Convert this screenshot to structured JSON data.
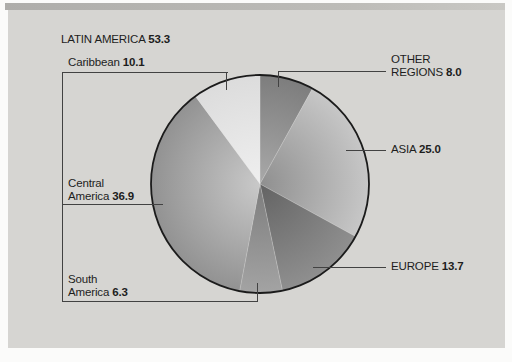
{
  "figure": {
    "panel_background": "#d6d5d2",
    "top_band_color": "#aeadaa",
    "page_color": "#fbfbfa",
    "leader_line_color": "#424242",
    "text_color": "#1d1d1d",
    "pie_outline_color": "#1b1b1b"
  },
  "labels": {
    "latin_america": {
      "name": "LATIN AMERICA",
      "value": "53.3"
    },
    "caribbean": {
      "name": "Caribbean",
      "value": "10.1"
    },
    "central_america": {
      "line1": "Central",
      "line2": "America",
      "value": "36.9"
    },
    "south_america": {
      "line1": "South",
      "line2": "America",
      "value": "6.3"
    },
    "other_regions": {
      "line1": "OTHER",
      "line2": "REGIONS",
      "value": "8.0"
    },
    "asia": {
      "name": "ASIA",
      "value": "25.0"
    },
    "europe": {
      "name": "EUROPE",
      "value": "13.7"
    }
  },
  "chart_data": {
    "type": "pie",
    "title": "",
    "start_angle_deg": 0,
    "direction": "clockwise",
    "center": {
      "x": 260,
      "y": 184
    },
    "radius": 109,
    "slices": [
      {
        "label": "Other regions",
        "value": 8.0,
        "color_center": "#a9a9a9",
        "color_rim": "#7d7d7d"
      },
      {
        "label": "Asia",
        "value": 25.0,
        "color_center": "#8f8f8f",
        "color_rim": "#c7c7c7"
      },
      {
        "label": "Europe",
        "value": 13.7,
        "color_center": "#636363",
        "color_rim": "#8f8f8f"
      },
      {
        "label": "South America",
        "value": 6.3,
        "color_center": "#7d7d7d",
        "color_rim": "#a3a3a3"
      },
      {
        "label": "Central America",
        "value": 36.9,
        "color_center": "#c9c9c9",
        "color_rim": "#929292"
      },
      {
        "label": "Caribbean",
        "value": 10.1,
        "color_center": "#efefef",
        "color_rim": "#dcdcdc"
      }
    ],
    "groups": [
      {
        "label": "LATIN AMERICA",
        "value": 53.3,
        "members": [
          "Caribbean",
          "Central America",
          "South America"
        ]
      }
    ],
    "legend_position": "callout-labels",
    "grid": false
  }
}
